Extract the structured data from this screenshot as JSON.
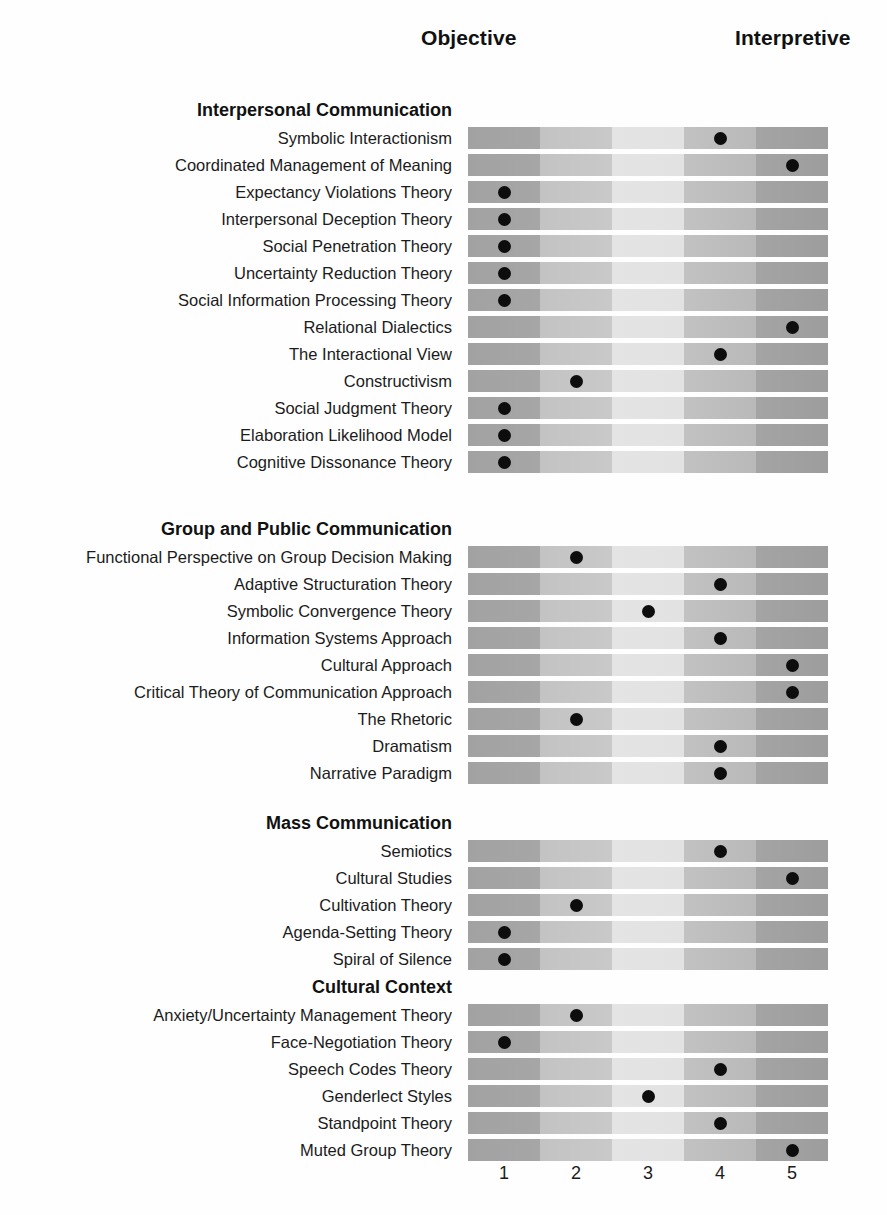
{
  "header": {
    "objective_label": "Objective",
    "interpretive_label": "Interpretive"
  },
  "scale": {
    "ticks": [
      "1",
      "2",
      "3",
      "4",
      "5"
    ]
  },
  "chart_data": {
    "type": "scatter",
    "title": "",
    "xlabel": "",
    "ylabel": "",
    "xlim": [
      1,
      5
    ],
    "x_tick_labels": [
      "1",
      "2",
      "3",
      "4",
      "5"
    ],
    "axis_endpoints": {
      "left": "Objective",
      "right": "Interpretive"
    },
    "grid": false,
    "legend": "none",
    "sections": [
      {
        "title": "Interpersonal Communication",
        "rows": [
          {
            "label": "Symbolic Interactionism",
            "value": 4
          },
          {
            "label": "Coordinated Management of Meaning",
            "value": 5
          },
          {
            "label": "Expectancy Violations Theory",
            "value": 1
          },
          {
            "label": "Interpersonal Deception Theory",
            "value": 1
          },
          {
            "label": "Social Penetration Theory",
            "value": 1
          },
          {
            "label": "Uncertainty Reduction Theory",
            "value": 1
          },
          {
            "label": "Social Information Processing Theory",
            "value": 1
          },
          {
            "label": "Relational Dialectics",
            "value": 5
          },
          {
            "label": "The Interactional View",
            "value": 4
          },
          {
            "label": "Constructivism",
            "value": 2
          },
          {
            "label": "Social Judgment Theory",
            "value": 1
          },
          {
            "label": "Elaboration Likelihood Model",
            "value": 1
          },
          {
            "label": "Cognitive Dissonance Theory",
            "value": 1
          }
        ]
      },
      {
        "title": "Group and Public Communication",
        "rows": [
          {
            "label": "Functional Perspective on Group Decision Making",
            "value": 2
          },
          {
            "label": "Adaptive Structuration Theory",
            "value": 4
          },
          {
            "label": "Symbolic Convergence Theory",
            "value": 3
          },
          {
            "label": "Information Systems Approach",
            "value": 4
          },
          {
            "label": "Cultural Approach",
            "value": 5
          },
          {
            "label": "Critical Theory of Communication Approach",
            "value": 5
          },
          {
            "label": "The Rhetoric",
            "value": 2
          },
          {
            "label": "Dramatism",
            "value": 4
          },
          {
            "label": "Narrative Paradigm",
            "value": 4
          }
        ]
      },
      {
        "title": "Mass Communication",
        "rows": [
          {
            "label": "Semiotics",
            "value": 4
          },
          {
            "label": "Cultural Studies",
            "value": 5
          },
          {
            "label": "Cultivation Theory",
            "value": 2
          },
          {
            "label": "Agenda-Setting Theory",
            "value": 1
          },
          {
            "label": "Spiral of Silence",
            "value": 1
          }
        ]
      },
      {
        "title": "Cultural Context",
        "rows": [
          {
            "label": "Anxiety/Uncertainty Management Theory",
            "value": 2
          },
          {
            "label": "Face-Negotiation Theory",
            "value": 1
          },
          {
            "label": "Speech Codes Theory",
            "value": 4
          },
          {
            "label": "Genderlect Styles",
            "value": 3
          },
          {
            "label": "Standpoint Theory",
            "value": 4
          },
          {
            "label": "Muted Group Theory",
            "value": 5
          }
        ]
      }
    ]
  }
}
